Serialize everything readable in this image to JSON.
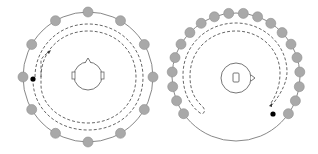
{
  "figure": {
    "width": 318,
    "height": 154,
    "colors": {
      "background": "#ffffff",
      "speaker_fill": "#a9a9a9",
      "speaker_stroke": "#8e8e8e",
      "ring_stroke": "#7a7a7a",
      "path_stroke": "#555555",
      "head_stroke": "#666666",
      "listener_dot": "#000000"
    },
    "panels": [
      {
        "name": "left-panel",
        "description": "Full ring of speakers surrounding a head facing up; dashed trajectory circling the listener",
        "center": [
          88,
          77
        ],
        "ring_radius": 65,
        "speaker_count": 12,
        "speaker_radius": 5,
        "speaker_start_deg": -90,
        "speaker_span_deg": 360,
        "head_orientation": "up",
        "listener_dot": [
          35,
          77
        ],
        "arrow_tip": [
          49,
          52
        ]
      },
      {
        "name": "right-panel",
        "description": "Partial ring of speakers (gap at bottom) surrounding a head facing right; dashed trajectory with turnaround",
        "center": [
          236,
          77
        ],
        "ring_radius": 64,
        "speaker_count": 20,
        "speaker_radius": 5,
        "speaker_start_deg": 145,
        "speaker_span_deg": 250,
        "head_orientation": "right",
        "listener_dot": [
          273,
          114
        ],
        "arrow_tip": [
          271,
          106
        ]
      }
    ]
  }
}
